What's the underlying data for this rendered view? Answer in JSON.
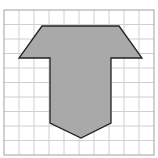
{
  "diagram": {
    "type": "grid-polygon",
    "grid": {
      "columns": 10,
      "rows": 10,
      "origin": [
        4,
        10
      ],
      "cell_size": 15,
      "line_color": "#d0d0d0",
      "border_color": "#a0a0a0"
    },
    "shape": {
      "fill": "#a9a9a9",
      "stroke": "#222222",
      "points_grid_units": [
        [
          2.5,
          1
        ],
        [
          7.5,
          1
        ],
        [
          9.2,
          3.2
        ],
        [
          7,
          3.2
        ],
        [
          7,
          7.5
        ],
        [
          5.1,
          8.5
        ],
        [
          3.1,
          7.5
        ],
        [
          3.1,
          3.2
        ],
        [
          1,
          3.2
        ]
      ],
      "points_px": "42,26 119,26 142,58 111,58 111,123 81,138 50,123 50,58 19,58"
    }
  }
}
